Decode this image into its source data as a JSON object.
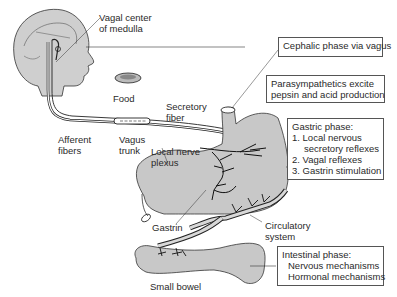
{
  "diagram": {
    "type": "physiology-illustration",
    "colors": {
      "organ_fill": "#c8c8c8",
      "line": "#222222",
      "box_border": "#555555"
    },
    "labels": {
      "vagal_center": [
        "Vagal center",
        "of medulla"
      ],
      "food": "Food",
      "afferent": [
        "Afferent",
        "fibers"
      ],
      "vagus_trunk": [
        "Vagus",
        "trunk"
      ],
      "secretory_fiber": [
        "Secretory",
        "fiber"
      ],
      "local_nerve_plexus": [
        "Local nerve",
        "plexus"
      ],
      "gastrin": "Gastrin",
      "circulatory": [
        "Circulatory",
        "system"
      ],
      "small_bowel": "Small bowel"
    },
    "boxes": {
      "cephalic": "Cephalic phase via vagus",
      "parasympathetics": [
        "Parasympathetics excite",
        "pepsin and acid production"
      ],
      "gastric": {
        "title": "Gastric phase:",
        "items": [
          "1. Local nervous",
          "secretory reflexes",
          "2. Vagal reflexes",
          "3. Gastrin stimulation"
        ]
      },
      "intestinal": {
        "title": "Intestinal phase:",
        "items": [
          "Nervous mechanisms",
          "Hormonal mechanisms"
        ]
      }
    }
  }
}
